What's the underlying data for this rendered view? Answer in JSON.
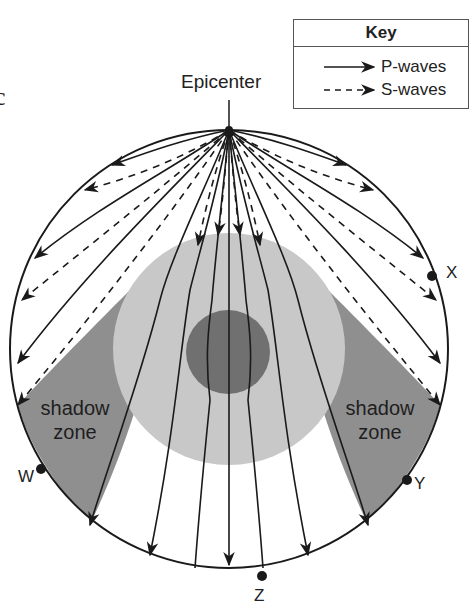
{
  "fragment_text": "c",
  "key": {
    "title": "Key",
    "items": [
      {
        "label": "P-waves",
        "line_style": "solid"
      },
      {
        "label": "S-waves",
        "line_style": "dashed"
      }
    ]
  },
  "diagram": {
    "epicenter_label": "Epicenter",
    "shadow_zone_left": "shadow zone",
    "shadow_zone_left_line1": "shadow",
    "shadow_zone_left_line2": "zone",
    "shadow_zone_right_line1": "shadow",
    "shadow_zone_right_line2": "zone",
    "points": [
      {
        "label": "W"
      },
      {
        "label": "X"
      },
      {
        "label": "Y"
      },
      {
        "label": "Z"
      }
    ],
    "colors": {
      "earth_outline": "#1a1a1a",
      "mantle": "#ffffff",
      "outer_core": "#c8c8c8",
      "inner_core": "#707070",
      "shadow_zone": "#8f8f8f"
    }
  }
}
